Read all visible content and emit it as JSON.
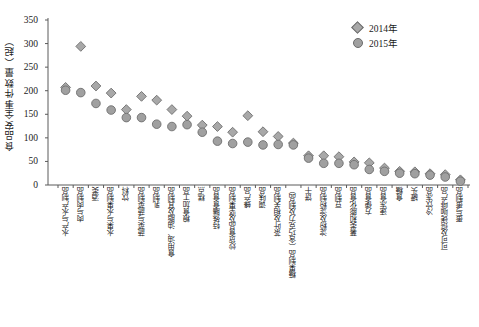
{
  "chart_data": {
    "type": "scatter",
    "title": "",
    "xlabel": "",
    "ylabel": "食品安全事件数量（起）",
    "ylim": [
      0,
      350
    ],
    "yticks": [
      0,
      50,
      100,
      150,
      200,
      250,
      300,
      350
    ],
    "grid": false,
    "legend_position": "top-right",
    "categories": [
      "水产与水产制品",
      "肉与肉制品",
      "酒类",
      "水果与水果制品",
      "饮料",
      "蔬菜与蔬菜制品",
      "乳制品",
      "食用油、油脂及其制品",
      "粮食加工品",
      "糕点",
      "特殊膳食食品",
      "炒货食品及坚果制品",
      "蜂产品",
      "调味品",
      "茶叶及相关制品",
      "糖果制品（含巧克力及制品）",
      "饼干",
      "淀粉及淀粉制品",
      "豆制品",
      "薯类和膨化食品",
      "方便食品",
      "速冻食品",
      "食糖",
      "罐头",
      "冷饮冻品",
      "可可及焙烤咖啡产品",
      "蛋与蛋制品"
    ],
    "series": [
      {
        "name": "2014年",
        "marker": "diamond",
        "color": "#a8a8a8",
        "values": [
          207,
          294,
          210,
          195,
          160,
          188,
          180,
          160,
          146,
          127,
          124,
          112,
          147,
          113,
          103,
          89,
          62,
          62,
          60,
          49,
          47,
          36,
          29,
          28,
          24,
          22,
          11
        ]
      },
      {
        "name": "2015年",
        "marker": "circle",
        "color": "#a0a0a0",
        "values": [
          201,
          196,
          173,
          159,
          143,
          143,
          129,
          124,
          128,
          112,
          93,
          88,
          91,
          85,
          86,
          85,
          57,
          46,
          46,
          43,
          33,
          29,
          25,
          24,
          21,
          17,
          8
        ]
      }
    ]
  },
  "legend": {
    "items": [
      {
        "label": "2014年",
        "marker": "diamond"
      },
      {
        "label": "2015年",
        "marker": "circle"
      }
    ]
  },
  "axis": {
    "y_title": "食品安全事件数量（起）"
  }
}
